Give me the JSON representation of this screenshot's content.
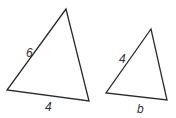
{
  "diagram": {
    "stroke_color": "#2a2a2a",
    "label_color": "#333333",
    "triangles": [
      {
        "name": "large-triangle",
        "points": "66,9 7,90 89,101",
        "labels": [
          {
            "text": "6",
            "x": 26,
            "y": 57,
            "side": "left"
          },
          {
            "text": "4",
            "x": 45,
            "y": 111,
            "side": "bottom"
          }
        ]
      },
      {
        "name": "small-triangle",
        "points": "151,29 106,93 167,100",
        "labels": [
          {
            "text": "4",
            "x": 119,
            "y": 63,
            "side": "left"
          },
          {
            "text": "b",
            "x": 137,
            "y": 113,
            "side": "bottom"
          }
        ]
      }
    ]
  }
}
